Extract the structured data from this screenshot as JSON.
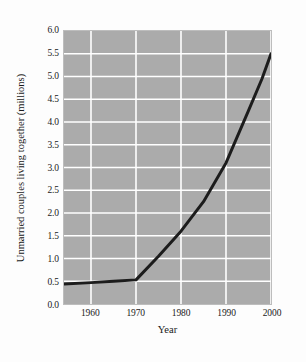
{
  "chart_data": {
    "type": "line",
    "title": "",
    "xlabel": "Year",
    "ylabel": "Unmarried couples living together (millions)",
    "xlim": [
      1954,
      2000
    ],
    "ylim": [
      0.0,
      6.0
    ],
    "grid": true,
    "legend_position": "none",
    "xticks": [
      "1960",
      "1970",
      "1980",
      "1990",
      "2000"
    ],
    "xtick_values": [
      1960,
      1970,
      1980,
      1990,
      2000
    ],
    "yticks": [
      "0.0",
      "0.5",
      "1.0",
      "1.5",
      "2.0",
      "2.5",
      "3.0",
      "3.5",
      "4.0",
      "4.5",
      "5.0",
      "5.5",
      "6.0"
    ],
    "ytick_values": [
      0.0,
      0.5,
      1.0,
      1.5,
      2.0,
      2.5,
      3.0,
      3.5,
      4.0,
      4.5,
      5.0,
      5.5,
      6.0
    ],
    "series": [
      {
        "name": "Unmarried couples living together",
        "color": "#1c1c1c",
        "line_width": 3,
        "x": [
          1954,
          1960,
          1965,
          1970,
          1975,
          1980,
          1985,
          1990,
          1995,
          1998,
          2000
        ],
        "values": [
          0.44,
          0.47,
          0.5,
          0.53,
          1.05,
          1.6,
          2.25,
          3.1,
          4.25,
          4.95,
          5.5
        ]
      }
    ],
    "annotations": [
      "Flat near 0.5 million from 1954 through 1970",
      "Steep near-linear rise after 1970",
      "Reaches about 5.5 million in 2000"
    ]
  },
  "figure": {
    "plot_background": "#ababab",
    "page_background": "#fdfdfd",
    "gridline_color": "#ffffff",
    "line_color": "#1c1c1c"
  }
}
